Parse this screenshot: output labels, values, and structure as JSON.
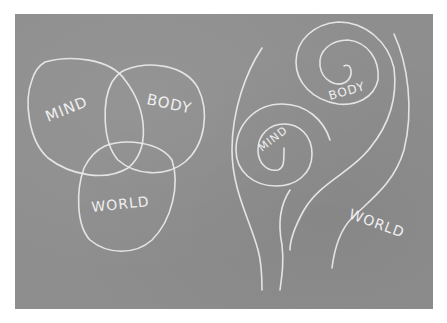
{
  "image": {
    "description": "Photograph of a gray chalkboard with two hand-drawn chalk diagrams",
    "colors": {
      "board": "#8e8e8e",
      "chalk": "#ececec",
      "margin": "#ffffff"
    }
  },
  "left_diagram": {
    "type": "venn",
    "labels": {
      "mind": "MIND",
      "body": "BODY",
      "world": "WORLD"
    }
  },
  "right_diagram": {
    "type": "nested-spirals",
    "labels": {
      "mind": "MIND",
      "body": "BODY",
      "world": "WORLD"
    }
  }
}
